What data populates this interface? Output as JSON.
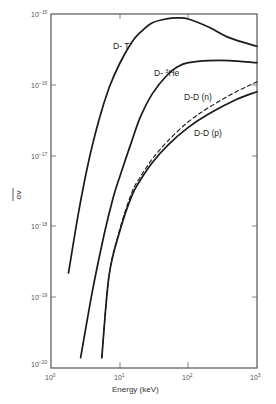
{
  "chart_data": {
    "type": "line",
    "title": "",
    "xlabel": "Energy (keV)",
    "ylabel": "σv (overbar)",
    "xscale": "log",
    "yscale": "log",
    "xlim": [
      1,
      1000
    ],
    "ylim": [
      1e-20,
      1e-15
    ],
    "x_ticks": [
      "10^0",
      "10^1",
      "10^2",
      "10^3"
    ],
    "y_ticks": [
      "10^-15",
      "10^-16",
      "10^-17",
      "10^-18",
      "10^-19",
      "10^-20"
    ],
    "grid": false,
    "legend": "inline labels",
    "series": [
      {
        "name": "D-T",
        "style": "solid",
        "x": [
          1.8,
          2.5,
          3.5,
          5,
          7,
          10,
          15,
          20,
          30,
          50,
          70,
          100,
          200,
          400,
          1000
        ],
        "y": [
          2.2e-19,
          1.5e-18,
          8e-18,
          3.2e-17,
          9e-17,
          2e-16,
          4e-16,
          5.5e-16,
          7.5e-16,
          8.6e-16,
          8.8e-16,
          8.5e-16,
          6.5e-16,
          4.6e-16,
          3.5e-16
        ]
      },
      {
        "name": "D-3He",
        "style": "solid",
        "x": [
          2.7,
          4,
          6,
          8,
          10,
          15,
          20,
          30,
          50,
          70,
          100,
          200,
          400,
          1000
        ],
        "y": [
          1.4e-20,
          1.2e-19,
          8e-19,
          2.5e-18,
          5e-18,
          1.6e-17,
          3.5e-17,
          7.5e-17,
          1.4e-16,
          1.8e-16,
          2.05e-16,
          2.2e-16,
          2.2e-16,
          2.05e-16
        ]
      },
      {
        "name": "D-D (n)",
        "style": "dashed",
        "x": [
          5.5,
          7,
          10,
          15,
          20,
          30,
          50,
          100,
          200,
          500,
          1000
        ],
        "y": [
          1.4e-20,
          2e-19,
          9e-19,
          3e-18,
          5e-18,
          9e-18,
          1.6e-17,
          3e-17,
          4.8e-17,
          8e-17,
          1.1e-16
        ]
      },
      {
        "name": "D-D (p)",
        "style": "solid",
        "x": [
          5.5,
          7,
          10,
          15,
          20,
          30,
          50,
          100,
          200,
          500,
          1000
        ],
        "y": [
          1.4e-20,
          2e-19,
          8.5e-19,
          2.7e-18,
          4.5e-18,
          8e-18,
          1.4e-17,
          2.5e-17,
          3.9e-17,
          6.2e-17,
          8e-17
        ]
      }
    ]
  },
  "labels": {
    "xlabel": "Energy (keV)",
    "ylabel": "σv",
    "x_ticks": [
      {
        "base": "10",
        "exp": "0"
      },
      {
        "base": "10",
        "exp": "1"
      },
      {
        "base": "10",
        "exp": "2"
      },
      {
        "base": "10",
        "exp": "3"
      }
    ],
    "y_ticks": [
      {
        "base": "10",
        "exp": "−15"
      },
      {
        "base": "10",
        "exp": "−16"
      },
      {
        "base": "10",
        "exp": "−17"
      },
      {
        "base": "10",
        "exp": "−18"
      },
      {
        "base": "10",
        "exp": "−19"
      },
      {
        "base": "10",
        "exp": "−20"
      }
    ],
    "curves": {
      "dt": "D- T",
      "dhe_prefix": "D- ",
      "dhe_sup": "3",
      "dhe_suffix": "He",
      "ddn": "D-D (n)",
      "ddp": "D-D (p)"
    }
  }
}
